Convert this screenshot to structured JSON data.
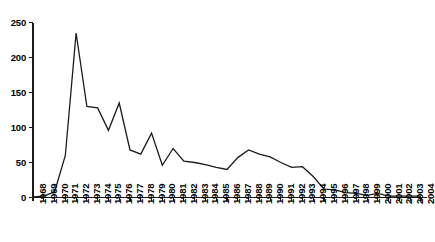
{
  "chart_data": {
    "type": "line",
    "title": "",
    "subtitle": "",
    "xlabel": "",
    "ylabel": "",
    "xlim": [
      1968,
      2004
    ],
    "ylim": [
      0,
      250
    ],
    "yticks": [
      0,
      50,
      100,
      150,
      200,
      250
    ],
    "grid": false,
    "legend": null,
    "legend_position": "none",
    "annotations": [],
    "line_color": "#1a1a1a",
    "axis_color": "#1a1a1a",
    "categories": [
      "1968",
      "1969",
      "1970",
      "1971",
      "1972",
      "1973",
      "1974",
      "1975",
      "1976",
      "1977",
      "1978",
      "1979",
      "1980",
      "1981",
      "1982",
      "1983",
      "1984",
      "1985",
      "1986",
      "1987",
      "1988",
      "1989",
      "1990",
      "1991",
      "1992",
      "1993",
      "1994",
      "1995",
      "1996",
      "1997",
      "1998",
      "1999",
      "2000",
      "2001",
      "2002",
      "2003",
      "2004"
    ],
    "values": [
      1,
      2,
      8,
      60,
      235,
      130,
      128,
      96,
      135,
      68,
      62,
      92,
      46,
      70,
      52,
      50,
      47,
      43,
      40,
      57,
      68,
      62,
      58,
      50,
      43,
      44,
      30,
      12,
      11,
      7,
      6,
      3,
      6,
      2,
      2,
      2,
      2
    ]
  }
}
